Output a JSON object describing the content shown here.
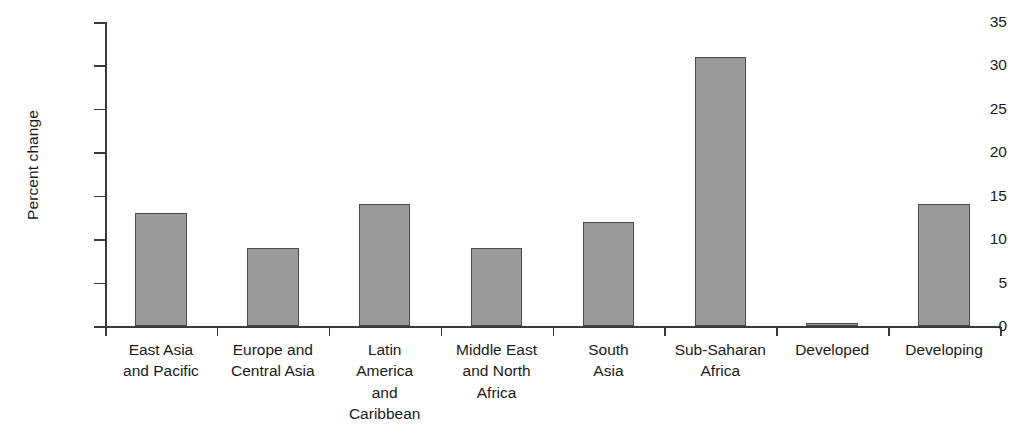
{
  "chart_data": {
    "type": "bar",
    "title": "",
    "xlabel": "",
    "ylabel": "Percent change",
    "ylim": [
      0,
      35
    ],
    "yticks": [
      0,
      5,
      10,
      15,
      20,
      25,
      30,
      35
    ],
    "ytick_labels": [
      "0",
      "5",
      "10",
      "15",
      "20",
      "25",
      "30",
      "35"
    ],
    "grid": false,
    "legend": null,
    "bar_color": "#9a9a9a",
    "bar_edge_color": "#4a4a4a",
    "background_color": "#ffffff",
    "categories": [
      "East Asia and Pacific",
      "Europe and Central Asia",
      "Latin America and Caribbean",
      "Middle East and North Africa",
      "South Asia",
      "Sub-Saharan Africa",
      "Developed",
      "Developing"
    ],
    "category_label_lines": [
      [
        "East Asia",
        "and Pacific"
      ],
      [
        "Europe and",
        "Central Asia"
      ],
      [
        "Latin",
        "America",
        "and",
        "Caribbean"
      ],
      [
        "Middle East",
        "and North",
        "Africa"
      ],
      [
        "South",
        "Asia"
      ],
      [
        "Sub-Saharan",
        "Africa"
      ],
      [
        "Developed"
      ],
      [
        "Developing"
      ]
    ],
    "values": [
      13,
      9,
      14,
      9,
      12,
      31,
      0.3,
      14
    ]
  }
}
